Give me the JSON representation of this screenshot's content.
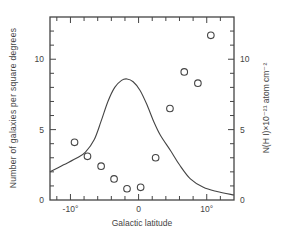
{
  "chart_data": {
    "type": "scatter",
    "title": "",
    "xlabel": "Galactic latitude",
    "ylabel": "Number of galaxies per square degrees",
    "ylabel_right": "N(H I)×10⁻²¹ atom cm⁻²",
    "xlim": [
      -13,
      14
    ],
    "ylim": [
      0,
      13
    ],
    "ylim_right": [
      0,
      13
    ],
    "grid": false,
    "legend": null,
    "x_ticks_major": [
      -10,
      0,
      10
    ],
    "x_tick_labels": [
      "-10°",
      "0",
      "10°"
    ],
    "x_ticks_minor_step": 2,
    "y_ticks_major": [
      0,
      5,
      10
    ],
    "y_tick_labels": [
      "0",
      "5",
      "10"
    ],
    "y_ticks_minor_step": 1,
    "y_right_tick_labels": [
      "0",
      "5",
      "10"
    ],
    "series": [
      {
        "name": "Galaxy counts",
        "type": "scatter",
        "marker": "open-circle",
        "axis": "left",
        "points": [
          {
            "x": -9.4,
            "y": 4.1
          },
          {
            "x": -7.5,
            "y": 3.1
          },
          {
            "x": -5.5,
            "y": 2.4
          },
          {
            "x": -3.6,
            "y": 1.5
          },
          {
            "x": -1.7,
            "y": 0.8
          },
          {
            "x": 0.3,
            "y": 0.9
          },
          {
            "x": 2.5,
            "y": 3.0
          },
          {
            "x": 4.6,
            "y": 6.5
          },
          {
            "x": 6.7,
            "y": 9.1
          },
          {
            "x": 8.7,
            "y": 8.3
          },
          {
            "x": 10.6,
            "y": 11.7
          }
        ]
      },
      {
        "name": "N(H I) column density",
        "type": "line",
        "axis": "right",
        "points": [
          {
            "x": -13,
            "y": 2.0
          },
          {
            "x": -11,
            "y": 2.5
          },
          {
            "x": -9,
            "y": 3.0
          },
          {
            "x": -7.8,
            "y": 3.4
          },
          {
            "x": -6.5,
            "y": 4.3
          },
          {
            "x": -5.5,
            "y": 5.6
          },
          {
            "x": -4.5,
            "y": 7.0
          },
          {
            "x": -3.5,
            "y": 8.0
          },
          {
            "x": -2.5,
            "y": 8.5
          },
          {
            "x": -1.7,
            "y": 8.6
          },
          {
            "x": -0.8,
            "y": 8.4
          },
          {
            "x": 0.2,
            "y": 7.8
          },
          {
            "x": 1.2,
            "y": 6.8
          },
          {
            "x": 2.2,
            "y": 5.6
          },
          {
            "x": 3.2,
            "y": 4.6
          },
          {
            "x": 4.7,
            "y": 3.5
          },
          {
            "x": 6.0,
            "y": 2.5
          },
          {
            "x": 7.6,
            "y": 1.5
          },
          {
            "x": 9.5,
            "y": 0.9
          },
          {
            "x": 11.5,
            "y": 0.6
          },
          {
            "x": 14,
            "y": 0.35
          }
        ]
      }
    ]
  }
}
